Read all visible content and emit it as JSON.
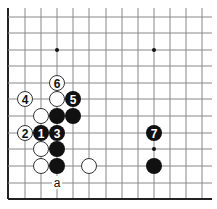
{
  "board": {
    "origin_x": 8,
    "origin_y": 8,
    "col_x": [
      8,
      25,
      41,
      57,
      73,
      89,
      106,
      122,
      138,
      154,
      170,
      186,
      202
    ],
    "row_y": [
      17,
      33,
      50,
      66,
      83,
      99,
      116,
      133,
      149,
      166,
      183,
      199
    ],
    "right_extent": 212,
    "stone_radius": 8,
    "line_color": "#888888",
    "edge_color": "#222222",
    "black_color": "#111111",
    "white_fill": "#ffffff",
    "white_stroke": "#333333"
  },
  "hoshi": [
    {
      "col": 3,
      "row": 2
    },
    {
      "col": 9,
      "row": 2
    },
    {
      "col": 9,
      "row": 8
    }
  ],
  "stones": [
    {
      "color": "white",
      "col": 3,
      "row": 4,
      "label": "6"
    },
    {
      "color": "white",
      "col": 1,
      "row": 5,
      "label": "4"
    },
    {
      "color": "white",
      "col": 3,
      "row": 5,
      "label": ""
    },
    {
      "color": "black",
      "col": 4,
      "row": 5,
      "label": "5"
    },
    {
      "color": "white",
      "col": 2,
      "row": 6,
      "label": ""
    },
    {
      "color": "black",
      "col": 3,
      "row": 6,
      "label": ""
    },
    {
      "color": "black",
      "col": 4,
      "row": 6,
      "label": ""
    },
    {
      "color": "white",
      "col": 1,
      "row": 7,
      "label": "2"
    },
    {
      "color": "black",
      "col": 2,
      "row": 7,
      "label": "1"
    },
    {
      "color": "black",
      "col": 3,
      "row": 7,
      "label": "3"
    },
    {
      "color": "white",
      "col": 2,
      "row": 8,
      "label": ""
    },
    {
      "color": "black",
      "col": 3,
      "row": 8,
      "label": ""
    },
    {
      "color": "white",
      "col": 2,
      "row": 9,
      "label": ""
    },
    {
      "color": "black",
      "col": 3,
      "row": 9,
      "label": ""
    },
    {
      "color": "white",
      "col": 5,
      "row": 9,
      "label": ""
    },
    {
      "color": "black",
      "col": 9,
      "row": 7,
      "label": "7"
    },
    {
      "color": "black",
      "col": 9,
      "row": 9,
      "label": ""
    }
  ],
  "marks": [
    {
      "col": 3,
      "row": 10,
      "label": "a"
    }
  ]
}
